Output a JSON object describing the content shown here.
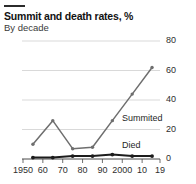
{
  "header": {
    "title": "Summit and death rates, %",
    "subtitle": "By decade"
  },
  "labels": {
    "summited": "Summited",
    "died": "Died"
  },
  "colors": {
    "summited": "#6e6e6e",
    "died": "#1c1c1c",
    "grid": "#cfcfcf",
    "axis": "#4a4a4a",
    "rule": "#2b2b2b"
  },
  "axes": {
    "y_ticks": [
      "80",
      "60",
      "40",
      "20",
      "0"
    ],
    "x_ticks": [
      "1950",
      "60",
      "70",
      "80",
      "90",
      "2000",
      "10",
      "19"
    ]
  },
  "chart_data": {
    "type": "line",
    "title": "Summit and death rates, %",
    "subtitle": "By decade",
    "xlabel": "",
    "ylabel": "",
    "ylim": [
      0,
      80
    ],
    "ytick_values": [
      80,
      60,
      40,
      20,
      0
    ],
    "xtick_labels": [
      "1950",
      "60",
      "70",
      "80",
      "90",
      "2000",
      "10",
      "19"
    ],
    "xtick_values": [
      1950,
      1960,
      1970,
      1980,
      1990,
      2000,
      2010,
      2019
    ],
    "grid": true,
    "legend": "inline-labels",
    "x": [
      1955,
      1965,
      1975,
      1985,
      1995,
      2005,
      2015
    ],
    "series": [
      {
        "name": "Summited",
        "color": "#6e6e6e",
        "values": [
          10,
          26,
          7,
          8,
          26,
          44,
          62
        ]
      },
      {
        "name": "Died",
        "color": "#1c1c1c",
        "values": [
          1,
          1,
          2,
          2,
          3,
          2,
          2
        ]
      }
    ]
  }
}
